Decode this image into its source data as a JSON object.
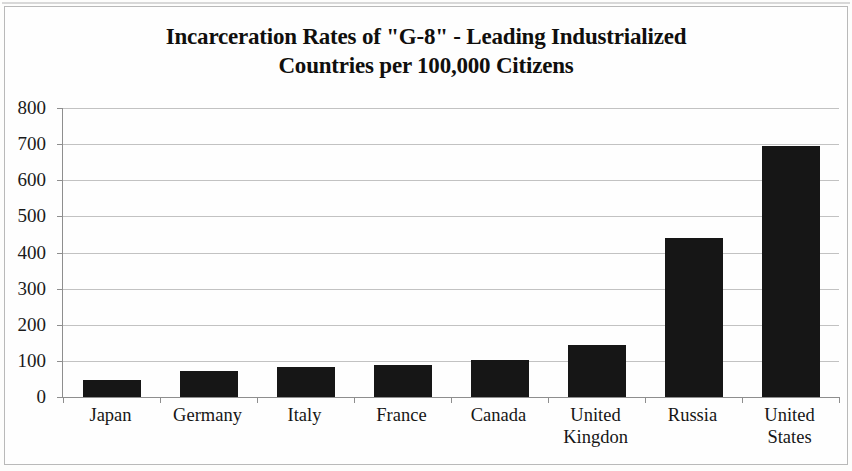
{
  "chart_data": {
    "type": "bar",
    "title": "Incarceration Rates of \"G-8\" - Leading Industrialized Countries per 100,000 Citizens",
    "title_lines": [
      "Incarceration Rates of \"G-8\" - Leading Industrialized",
      "Countries per 100,000 Citizens"
    ],
    "categories": [
      "Japan",
      "Germany",
      "Italy",
      "France",
      "Canada",
      "United\nKingdon",
      "Russia",
      "United\nStates"
    ],
    "category_labels_flat": [
      "Japan",
      "Germany",
      "Italy",
      "France",
      "Canada",
      "United Kingdon",
      "Russia",
      "United States"
    ],
    "values": [
      46,
      73,
      82,
      88,
      103,
      145,
      440,
      695
    ],
    "xlabel": "",
    "ylabel": "",
    "ylim": [
      0,
      800
    ],
    "ytick_step": 100,
    "ytick_labels": [
      "800",
      "700",
      "600",
      "500",
      "400",
      "300",
      "200",
      "100",
      "0"
    ],
    "ytick_values": [
      800,
      700,
      600,
      500,
      400,
      300,
      200,
      100,
      0
    ],
    "grid": true,
    "grid_axis": "y",
    "legend": false,
    "legend_position": "none",
    "bar_color": "#161616",
    "grid_color": "#c2c2c2",
    "axis_color": "#8e8e8e",
    "background_color": "#fefefe",
    "text_color": "#161616"
  }
}
